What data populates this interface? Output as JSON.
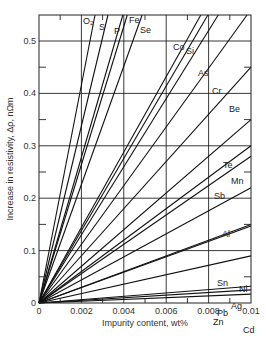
{
  "chart_data": {
    "type": "line",
    "title": "",
    "xlabel": "Impurity content, wt%",
    "ylabel": "Increase in resistivity, Δρ, nΩm",
    "xlim": [
      0,
      0.01
    ],
    "ylim": [
      0,
      0.55
    ],
    "x_ticks": [
      0,
      0.002,
      0.004,
      0.006,
      0.008,
      0.01
    ],
    "x_tick_labels": [
      "0",
      "0.002",
      "0.004",
      "0.006",
      "0.008",
      "0.01"
    ],
    "y_ticks": [
      0,
      0.1,
      0.2,
      0.3,
      0.4,
      0.5
    ],
    "y_tick_labels": [
      "0",
      "0.1",
      "0.2",
      "0.3",
      "0.4",
      "0.5"
    ],
    "grid": true,
    "legend": "inline labels",
    "note": "Each series is a straight line from the origin; values give Δρ (nΩm) at x = 0.01 wt% (extrapolated beyond plot top where steep).",
    "series": [
      {
        "name": "O₂",
        "x": [
          0,
          0.01
        ],
        "values": [
          0,
          2.08
        ]
      },
      {
        "name": "S",
        "x": [
          0,
          0.01
        ],
        "values": [
          0,
          1.69
        ]
      },
      {
        "name": "P",
        "x": [
          0,
          0.01
        ],
        "values": [
          0,
          1.39
        ]
      },
      {
        "name": "Fe",
        "x": [
          0,
          0.01
        ],
        "values": [
          0,
          1.32
        ]
      },
      {
        "name": "Se",
        "x": [
          0,
          0.01
        ],
        "values": [
          0,
          1.13
        ]
      },
      {
        "name": "Co",
        "x": [
          0,
          0.01
        ],
        "values": [
          0,
          0.72
        ]
      },
      {
        "name": "Si",
        "x": [
          0,
          0.01
        ],
        "values": [
          0,
          0.69
        ]
      },
      {
        "name": "As",
        "x": [
          0,
          0.01
        ],
        "values": [
          0,
          0.65
        ]
      },
      {
        "name": "Cr",
        "x": [
          0,
          0.01
        ],
        "values": [
          0,
          0.56
        ]
      },
      {
        "name": "Be",
        "x": [
          0,
          0.01
        ],
        "values": [
          0,
          0.45
        ]
      },
      {
        "name": "Te",
        "x": [
          0,
          0.01
        ],
        "values": [
          0,
          0.35
        ]
      },
      {
        "name": "Mn",
        "x": [
          0,
          0.01
        ],
        "values": [
          0,
          0.3
        ]
      },
      {
        "name": "Sb",
        "x": [
          0,
          0.01
        ],
        "values": [
          0,
          0.28
        ]
      },
      {
        "name": "Al",
        "x": [
          0,
          0.01
        ],
        "values": [
          0,
          0.22
        ]
      },
      {
        "name": "Sn",
        "x": [
          0,
          0.01
        ],
        "values": [
          0,
          0.15
        ]
      },
      {
        "name": "Ni",
        "x": [
          0,
          0.01
        ],
        "values": [
          0,
          0.147
        ]
      },
      {
        "name": "Pb",
        "x": [
          0,
          0.01
        ],
        "values": [
          0,
          0.09
        ]
      },
      {
        "name": "Zn",
        "x": [
          0,
          0.01
        ],
        "values": [
          0,
          0.032
        ]
      },
      {
        "name": "Ag",
        "x": [
          0,
          0.01
        ],
        "values": [
          0,
          0.025
        ]
      },
      {
        "name": "Cd",
        "x": [
          0,
          0.01
        ],
        "values": [
          0,
          0.017
        ]
      }
    ],
    "label_positions": [
      {
        "name": "O₂",
        "x": 83,
        "y": 24
      },
      {
        "name": "S",
        "x": 99,
        "y": 30
      },
      {
        "name": "P",
        "x": 114,
        "y": 34
      },
      {
        "name": "Fe",
        "x": 129,
        "y": 23
      },
      {
        "name": "Se",
        "x": 140,
        "y": 33
      },
      {
        "name": "Co",
        "x": 173,
        "y": 50
      },
      {
        "name": "Si",
        "x": 186,
        "y": 54
      },
      {
        "name": "As",
        "x": 198,
        "y": 76
      },
      {
        "name": "Cr",
        "x": 212,
        "y": 94
      },
      {
        "name": "Be",
        "x": 229,
        "y": 112
      },
      {
        "name": "Te",
        "x": 223,
        "y": 168
      },
      {
        "name": "Mn",
        "x": 231,
        "y": 184
      },
      {
        "name": "Sb",
        "x": 214,
        "y": 199
      },
      {
        "name": "Al",
        "x": 222,
        "y": 237
      },
      {
        "name": "Sn",
        "x": 217,
        "y": 286
      },
      {
        "name": "Ni",
        "x": 239,
        "y": 292
      },
      {
        "name": "Pb",
        "x": 217,
        "y": 316
      },
      {
        "name": "Zn",
        "x": 213,
        "y": 325
      },
      {
        "name": "Ag",
        "x": 231,
        "y": 309
      },
      {
        "name": "Cd",
        "x": 243,
        "y": 333
      }
    ]
  }
}
